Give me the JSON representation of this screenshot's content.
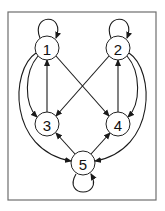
{
  "diagram": {
    "type": "directed-graph",
    "frame": {
      "x": 8,
      "y": 12,
      "width": 148,
      "height": 188
    },
    "node_radius": 12,
    "nodes": [
      {
        "id": "1",
        "label": "1",
        "x": 47,
        "y": 48
      },
      {
        "id": "2",
        "label": "2",
        "x": 118,
        "y": 48
      },
      {
        "id": "3",
        "label": "3",
        "x": 47,
        "y": 124
      },
      {
        "id": "4",
        "label": "4",
        "x": 118,
        "y": 124
      },
      {
        "id": "5",
        "label": "5",
        "x": 83,
        "y": 163
      }
    ],
    "edges": [
      {
        "from": "1",
        "to": "1",
        "kind": "self-loop",
        "path": "M40,38 C30,14 66,12 56,38"
      },
      {
        "from": "2",
        "to": "2",
        "kind": "self-loop",
        "path": "M111,38 C101,14 137,12 127,38"
      },
      {
        "from": "5",
        "to": "5",
        "kind": "self-loop",
        "path": "M76,174 C62,198 104,198 91,174"
      },
      {
        "from": "3",
        "to": "1",
        "kind": "straight",
        "path": "M47,112 L47,60"
      },
      {
        "from": "4",
        "to": "2",
        "kind": "straight",
        "path": "M118,112 L118,60"
      },
      {
        "from": "1",
        "to": "4",
        "kind": "straight",
        "path": "M56,56 L109,116"
      },
      {
        "from": "2",
        "to": "3",
        "kind": "straight",
        "path": "M109,56 L56,116"
      },
      {
        "from": "1",
        "to": "3",
        "kind": "curve",
        "path": "M38,56 C24,72 24,104 37,117"
      },
      {
        "from": "1",
        "to": "5",
        "kind": "curve",
        "path": "M36,53 C10,70 8,150 71,161"
      },
      {
        "from": "2",
        "to": "4",
        "kind": "curve",
        "path": "M127,56 C141,72 141,104 128,117"
      },
      {
        "from": "2",
        "to": "5",
        "kind": "curve",
        "path": "M129,53 C155,70 157,150 95,161"
      },
      {
        "from": "5",
        "to": "3",
        "kind": "straight",
        "path": "M75,154 L56,133"
      },
      {
        "from": "5",
        "to": "4",
        "kind": "straight",
        "path": "M91,154 L110,133"
      }
    ],
    "colors": {
      "stroke": "#1a1a1a",
      "frame": "#6e6e6e",
      "node_fill": "#ffffff"
    }
  }
}
